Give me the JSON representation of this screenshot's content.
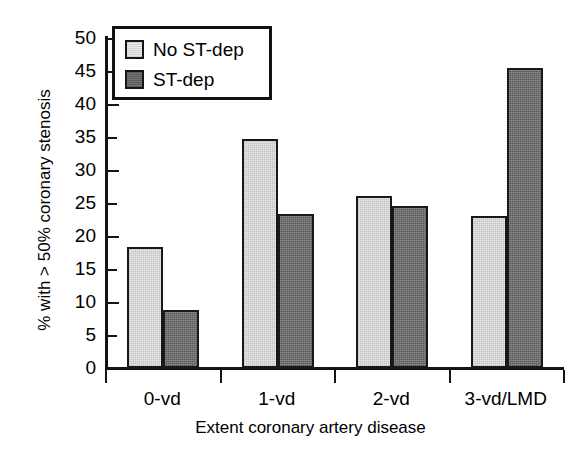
{
  "chart_data": {
    "type": "bar",
    "title": "",
    "xlabel": "Extent coronary artery disease",
    "ylabel": "% with > 50% coronary stenosis",
    "categories": [
      "0-vd",
      "1-vd",
      "2-vd",
      "3-vd/LMD"
    ],
    "series": [
      {
        "name": "No ST-dep",
        "values": [
          18.4,
          34.7,
          26.0,
          23.1
        ],
        "color": "#e9e9e9"
      },
      {
        "name": "ST-dep",
        "values": [
          8.8,
          23.4,
          24.6,
          45.5
        ],
        "color": "#767676"
      }
    ],
    "ylim": [
      0,
      50
    ],
    "ytick_labels": [
      "50",
      "45",
      "40",
      "35",
      "30",
      "25",
      "20",
      "15",
      "10",
      "5",
      "0"
    ],
    "ytick_values": [
      50,
      45,
      40,
      35,
      30,
      25,
      20,
      15,
      10,
      5,
      0
    ],
    "ytick_interval": 5,
    "grid": false,
    "legend_position": "upper-left",
    "legend_entries": [
      "No ST-dep",
      "ST-dep"
    ],
    "axis_color": "#141414",
    "bar_edge_color": "#181818",
    "background_color": "#ffffff"
  }
}
